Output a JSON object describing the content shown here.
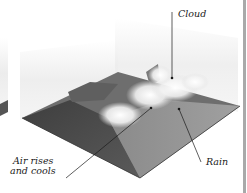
{
  "diagram": {
    "topic": "orographic rainfall",
    "labels": {
      "cloud": "Cloud",
      "rain": "Rain",
      "air_line1": "Air rises",
      "air_line2": "and cools"
    },
    "colors": {
      "background": "#ffffff",
      "terrain_dark": "#4a4a4a",
      "terrain_mid": "#6b6b6b",
      "terrain_light": "#8e8e8e",
      "cloud": "#f4f4f4",
      "backdrop_panel": "#ececec",
      "leader_line": "#1a1a1a",
      "right_edge": "#a9a9a9"
    }
  }
}
